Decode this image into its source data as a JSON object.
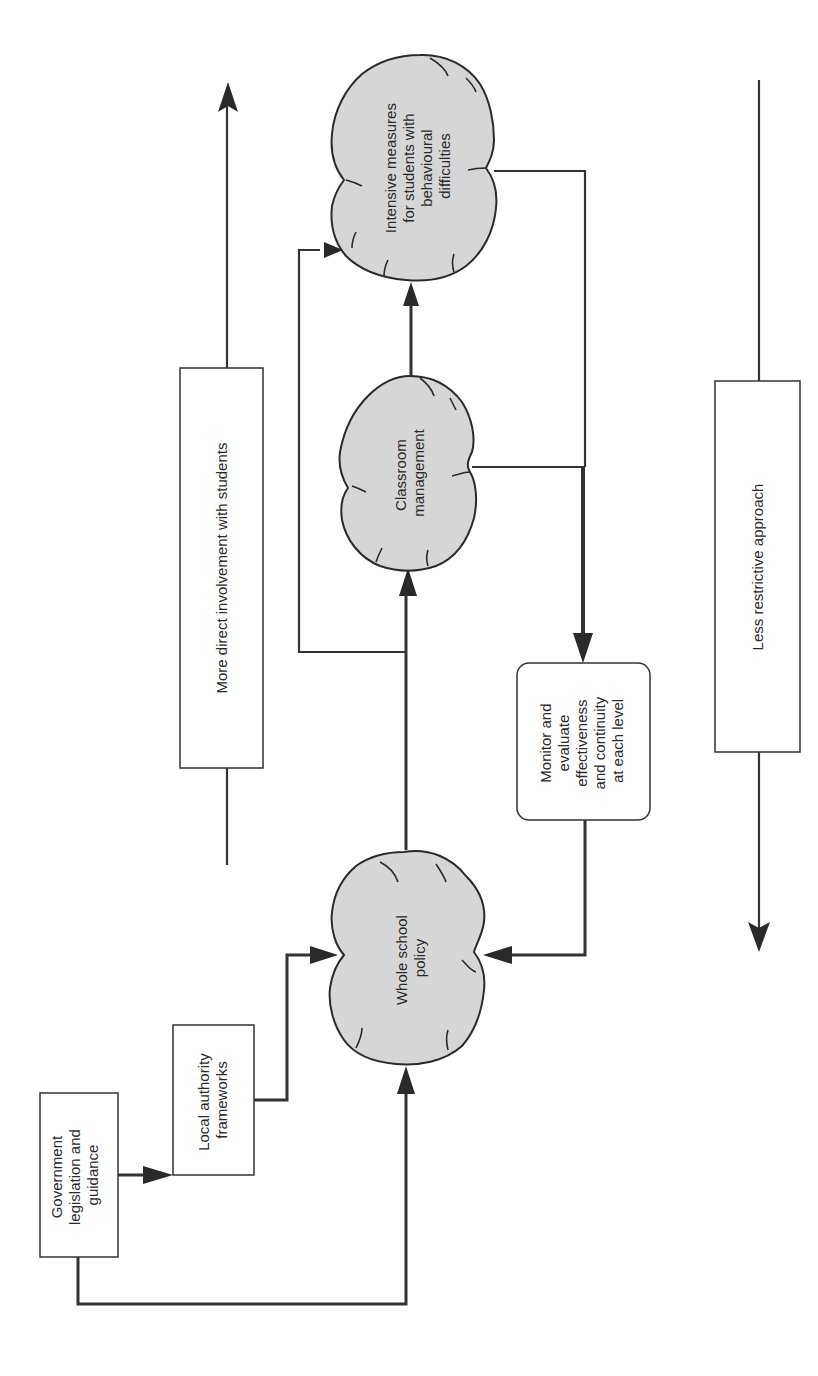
{
  "diagram": {
    "orientation": "rotated-90-counterclockwise",
    "colors": {
      "background": "#ffffff",
      "cloud_fill": "#d6d6d6",
      "stroke": "#2a2a2a"
    },
    "nodes": {
      "government": {
        "shape": "rectangle",
        "lines": [
          "Government",
          "legislation and",
          "guidance"
        ]
      },
      "local_authority": {
        "shape": "rectangle",
        "lines": [
          "Local authority",
          "frameworks"
        ]
      },
      "whole_school": {
        "shape": "cloud",
        "lines": [
          "Whole school",
          "policy"
        ]
      },
      "classroom": {
        "shape": "cloud",
        "lines": [
          "Classroom",
          "management"
        ]
      },
      "intensive": {
        "shape": "cloud",
        "lines": [
          "Intensive measures",
          "for students with",
          "behavioural",
          "difficulties"
        ]
      },
      "monitor": {
        "shape": "rounded-rectangle",
        "lines": [
          "Monitor and",
          "evaluate",
          "effectiveness",
          "and continuity",
          "at each level"
        ]
      },
      "more_direct": {
        "shape": "rectangle",
        "lines": [
          "More direct involvement with students"
        ]
      },
      "less_restrictive": {
        "shape": "rectangle",
        "lines": [
          "Less restrictive approach"
        ]
      }
    },
    "edges": [
      {
        "from": "government",
        "to": "local_authority"
      },
      {
        "from": "government",
        "to": "whole_school"
      },
      {
        "from": "local_authority",
        "to": "whole_school"
      },
      {
        "from": "whole_school",
        "to": "classroom"
      },
      {
        "from": "whole_school",
        "to": "intensive"
      },
      {
        "from": "classroom",
        "to": "intensive"
      },
      {
        "from": "classroom",
        "to": "monitor"
      },
      {
        "from": "intensive",
        "to": "monitor"
      },
      {
        "from": "monitor",
        "to": "whole_school"
      }
    ],
    "axes": [
      {
        "label_node": "more_direct",
        "direction": "toward intensive measures"
      },
      {
        "label_node": "less_restrictive",
        "direction": "toward whole school policy"
      }
    ]
  }
}
